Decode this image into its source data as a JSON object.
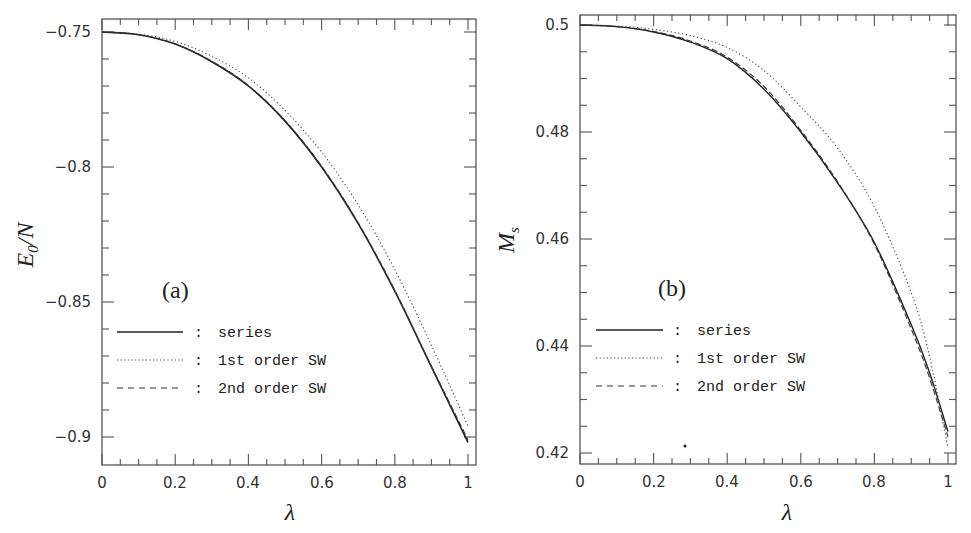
{
  "chart_data": [
    {
      "type": "line",
      "panel": "(a)",
      "title": "",
      "xlabel": "λ",
      "ylabel": "E0/N",
      "xlim": [
        0,
        1
      ],
      "ylim": [
        -0.905,
        -0.745
      ],
      "xticks": [
        "0",
        "0.2",
        "0.4",
        "0.6",
        "0.8",
        "1"
      ],
      "yticks": [
        "-0.75",
        "-0.8",
        "-0.85",
        "-0.9"
      ],
      "grid": false,
      "legend_position": "lower left",
      "x": [
        0,
        0.1,
        0.2,
        0.3,
        0.4,
        0.5,
        0.6,
        0.7,
        0.8,
        0.9,
        1.0
      ],
      "series": [
        {
          "name": "series",
          "style": "solid",
          "values": [
            -0.75,
            -0.751,
            -0.7545,
            -0.761,
            -0.77,
            -0.783,
            -0.8,
            -0.821,
            -0.846,
            -0.874,
            -0.902
          ]
        },
        {
          "name": "1st order SW",
          "style": "dotted",
          "values": [
            -0.75,
            -0.7508,
            -0.7535,
            -0.759,
            -0.767,
            -0.779,
            -0.7945,
            -0.814,
            -0.838,
            -0.866,
            -0.896
          ]
        },
        {
          "name": "2nd order SW",
          "style": "dashed",
          "values": [
            -0.75,
            -0.751,
            -0.7544,
            -0.7608,
            -0.7698,
            -0.7828,
            -0.7997,
            -0.8207,
            -0.8457,
            -0.8738,
            -0.901
          ]
        }
      ]
    },
    {
      "type": "line",
      "panel": "(b)",
      "title": "",
      "xlabel": "λ",
      "ylabel": "Ms",
      "xlim": [
        0,
        1
      ],
      "ylim": [
        0.418,
        0.502
      ],
      "xticks": [
        "0",
        "0.2",
        "0.4",
        "0.6",
        "0.8",
        "1"
      ],
      "yticks": [
        "0.5",
        "0.48",
        "0.46",
        "0.44",
        "0.42"
      ],
      "grid": false,
      "legend_position": "lower left",
      "x": [
        0,
        0.1,
        0.2,
        0.3,
        0.4,
        0.5,
        0.6,
        0.7,
        0.8,
        0.9,
        0.95,
        1.0
      ],
      "series": [
        {
          "name": "series",
          "style": "solid",
          "values": [
            0.5,
            0.4997,
            0.4987,
            0.4968,
            0.4937,
            0.488,
            0.48,
            0.4705,
            0.4593,
            0.444,
            0.435,
            0.424
          ]
        },
        {
          "name": "1st order SW",
          "style": "dotted",
          "values": [
            0.5,
            0.4998,
            0.4992,
            0.498,
            0.4958,
            0.4915,
            0.4847,
            0.477,
            0.466,
            0.45,
            0.438,
            0.421
          ]
        },
        {
          "name": "2nd order SW",
          "style": "dashed",
          "values": [
            0.5,
            0.4997,
            0.4988,
            0.497,
            0.494,
            0.4885,
            0.4803,
            0.4707,
            0.459,
            0.4432,
            0.434,
            0.423
          ]
        }
      ]
    }
  ],
  "left": {
    "panel_label": "(a)",
    "ylabel_main": "E",
    "ylabel_sub": "0",
    "ylabel_rest": "/N",
    "xlabel": "λ",
    "yticks": [
      {
        "label": "−0.75"
      },
      {
        "label": "−0.8"
      },
      {
        "label": "−0.85"
      },
      {
        "label": "−0.9"
      }
    ],
    "xticks": [
      {
        "label": "0"
      },
      {
        "label": "0.2"
      },
      {
        "label": "0.4"
      },
      {
        "label": "0.6"
      },
      {
        "label": "0.8"
      },
      {
        "label": "1"
      }
    ],
    "legend": [
      {
        "sep": ":",
        "label": "series"
      },
      {
        "sep": ":",
        "label": "1st order SW"
      },
      {
        "sep": ":",
        "label": "2nd order SW"
      }
    ]
  },
  "right": {
    "panel_label": "(b)",
    "ylabel_main": "M",
    "ylabel_sub": "s",
    "xlabel": "λ",
    "yticks": [
      {
        "label": "0.5"
      },
      {
        "label": "0.48"
      },
      {
        "label": "0.46"
      },
      {
        "label": "0.44"
      },
      {
        "label": "0.42"
      }
    ],
    "xticks": [
      {
        "label": "0"
      },
      {
        "label": "0.2"
      },
      {
        "label": "0.4"
      },
      {
        "label": "0.6"
      },
      {
        "label": "0.8"
      },
      {
        "label": "1"
      }
    ],
    "legend": [
      {
        "sep": ":",
        "label": "series"
      },
      {
        "sep": ":",
        "label": "1st order SW"
      },
      {
        "sep": ":",
        "label": "2nd order SW"
      }
    ]
  }
}
